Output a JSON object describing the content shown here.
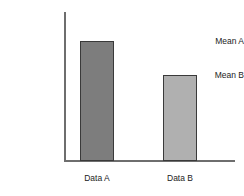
{
  "chart_data": {
    "type": "bar",
    "title": "",
    "subtitle": "",
    "xlabel": "",
    "ylabel": "",
    "categories": [
      "Data A",
      "Data B"
    ],
    "values": [
      119,
      85
    ],
    "value_labels": [
      "Mean A",
      "Mean B"
    ],
    "ytick_labels": [
      "Mean A",
      "Mean B"
    ],
    "xtick_labels": [
      "Data A",
      "Data B"
    ],
    "grid": false,
    "legend": false,
    "legend_position": "none",
    "ylim": [
      0,
      148
    ],
    "annotations": [],
    "bar_colors": [
      "#7d7d7d",
      "#b0b0b0"
    ],
    "bar_border_color": "#3a3a3a",
    "axis_color": "#6e6e6e",
    "text_color": "#1c1c1c",
    "background_color": "#ffffff"
  },
  "axes": {
    "y_axis_name": "vertical-axis",
    "x_axis_name": "horizontal-axis"
  }
}
